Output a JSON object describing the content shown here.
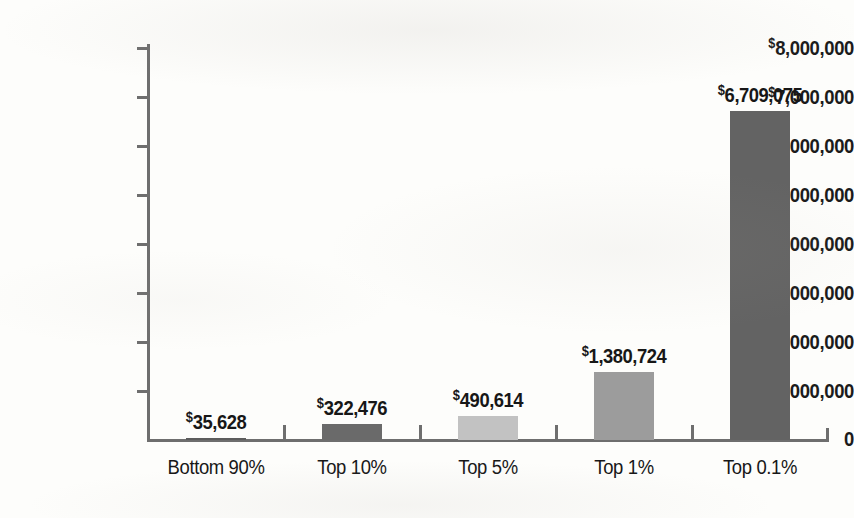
{
  "chart_data": {
    "type": "bar",
    "title": "",
    "subtitle": "",
    "xlabel": "",
    "ylabel": "",
    "categories": [
      "Bottom 90%",
      "Top 10%",
      "Top 5%",
      "Top 1%",
      "Top 0.1%"
    ],
    "values": [
      35628,
      322476,
      490614,
      1380724,
      6709075
    ],
    "value_labels": [
      "$35,628",
      "$322,476",
      "$490,614",
      "$1,380,724",
      "$6,709,075"
    ],
    "currency_symbol": "$",
    "ylim": [
      0,
      8000000
    ],
    "ytick_values": [
      0,
      1000000,
      2000000,
      3000000,
      4000000,
      5000000,
      6000000,
      7000000,
      8000000
    ],
    "ytick_labels": [
      "0",
      "$1,000,000",
      "$2,000,000",
      "$3,000,000",
      "$4,000,000",
      "$5,000,000",
      "$6,000,000",
      "$7,000,000",
      "$8,000,000"
    ],
    "grid": false,
    "legend": null,
    "bar_colors": [
      "#5c5c5c",
      "#6a6a6a",
      "#c2c2c2",
      "#9c9c9c",
      "#636363"
    ],
    "axis_color": "#6e6e6e",
    "text_color": "#171717",
    "background_color": "#fdfdfb"
  },
  "yaxis": {
    "ticks": [
      {
        "label_prefix": "$",
        "label_body": "8,000,000",
        "value": 8000000
      },
      {
        "label_prefix": "$",
        "label_body": "7,000,000",
        "value": 7000000
      },
      {
        "label_prefix": "$",
        "label_body": "6,000,000",
        "value": 6000000
      },
      {
        "label_prefix": "$",
        "label_body": "5,000,000",
        "value": 5000000
      },
      {
        "label_prefix": "$",
        "label_body": "4,000,000",
        "value": 4000000
      },
      {
        "label_prefix": "$",
        "label_body": "3,000,000",
        "value": 3000000
      },
      {
        "label_prefix": "$",
        "label_body": "2,000,000",
        "value": 2000000
      },
      {
        "label_prefix": "$",
        "label_body": "1,000,000",
        "value": 1000000
      },
      {
        "label_prefix": "",
        "label_body": "0",
        "value": 0
      }
    ]
  },
  "bars": [
    {
      "category": "Bottom 90%",
      "value": 35628,
      "label_prefix": "$",
      "label_body": "35,628",
      "color": "#5c5c5c"
    },
    {
      "category": "Top 10%",
      "value": 322476,
      "label_prefix": "$",
      "label_body": "322,476",
      "color": "#6a6a6a"
    },
    {
      "category": "Top 5%",
      "value": 490614,
      "label_prefix": "$",
      "label_body": "490,614",
      "color": "#c2c2c2"
    },
    {
      "category": "Top 1%",
      "value": 1380724,
      "label_prefix": "$",
      "label_body": "1,380,724",
      "color": "#9c9c9c"
    },
    {
      "category": "Top 0.1%",
      "value": 6709075,
      "label_prefix": "$",
      "label_body": "6,709,075",
      "color": "#636363"
    }
  ]
}
